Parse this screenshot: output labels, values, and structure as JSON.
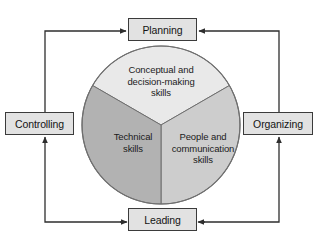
{
  "diagram": {
    "type": "management-functions-and-skills",
    "process_boxes": [
      {
        "id": "planning",
        "label": "Planning"
      },
      {
        "id": "organizing",
        "label": "Organizing"
      },
      {
        "id": "leading",
        "label": "Leading"
      },
      {
        "id": "controlling",
        "label": "Controlling"
      }
    ],
    "pie": {
      "center": {
        "x": 161,
        "y": 125
      },
      "radius": 79,
      "slices": [
        {
          "id": "conceptual",
          "label": "Conceptual and\ndecision-making\nskills",
          "color": "#e9e9e9",
          "start_angle": 210,
          "end_angle": 330,
          "share": 33.3
        },
        {
          "id": "people",
          "label": "People and\ncommunication\nskills",
          "color": "#cdcdcd",
          "start_angle": 330,
          "end_angle": 90,
          "share": 33.3
        },
        {
          "id": "technical",
          "label": "Technical\nskills",
          "color": "#b2b2b2",
          "start_angle": 90,
          "end_angle": 210,
          "share": 33.4
        }
      ]
    },
    "connectors": [
      {
        "id": "controlling-to-planning",
        "from": "controlling",
        "to": "planning"
      },
      {
        "id": "planning-to-organizing",
        "from": "planning",
        "to": "organizing"
      },
      {
        "id": "organizing-to-leading",
        "from": "organizing",
        "to": "leading"
      },
      {
        "id": "leading-to-controlling",
        "from": "leading",
        "to": "controlling"
      }
    ],
    "colors": {
      "box_fill": "#e2e2e2",
      "box_border": "#3b3b3b",
      "arrow": "#2e2e2e",
      "circle_border": "#6a6a6a",
      "text": "#141414"
    }
  }
}
